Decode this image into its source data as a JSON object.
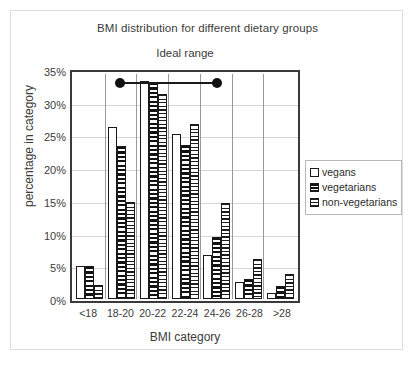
{
  "chart_data": {
    "type": "bar",
    "title": "BMI distribution for different dietary groups",
    "xlabel": "BMI category",
    "ylabel": "percentage in category",
    "categories": [
      "<18",
      "18-20",
      "20-22",
      "22-24",
      "24-26",
      "26-28",
      ">28"
    ],
    "series": [
      {
        "name": "vegans",
        "pattern": "solid-white",
        "values": [
          5.0,
          26.3,
          33.4,
          25.2,
          6.7,
          2.6,
          0.9
        ]
      },
      {
        "name": "vegetarians",
        "pattern": "horizontal-stripes",
        "values": [
          5.1,
          23.4,
          33.1,
          23.6,
          9.5,
          3.1,
          2.0
        ]
      },
      {
        "name": "non-vegetarians",
        "pattern": "dotted-checker",
        "values": [
          2.1,
          14.9,
          31.3,
          26.8,
          14.7,
          6.1,
          3.8
        ]
      }
    ],
    "ylim": [
      0,
      35
    ],
    "yticks": [
      "0%",
      "5%",
      "10%",
      "15%",
      "20%",
      "25%",
      "30%",
      "35%"
    ],
    "ytick_values": [
      0,
      5,
      10,
      15,
      20,
      25,
      30,
      35
    ],
    "grid": true,
    "legend_position": "right",
    "annotations": [
      {
        "label": "Ideal range",
        "type": "range-bar-with-endpoint-dots",
        "y_value": 33.5,
        "x_start_category": "18-20",
        "x_end_category": "24-26"
      }
    ],
    "colors": {
      "axis": "#3a3a3a",
      "grid": "#d6d6d6",
      "bar_outline": "#1a1a1a",
      "pattern": "#111111",
      "text": "#3b3b3b",
      "background": "#ffffff",
      "frame": "#dddddd"
    }
  },
  "legend": {
    "items": [
      {
        "label": "vegans"
      },
      {
        "label": "vegetarians"
      },
      {
        "label": "non-vegetarians"
      }
    ]
  }
}
